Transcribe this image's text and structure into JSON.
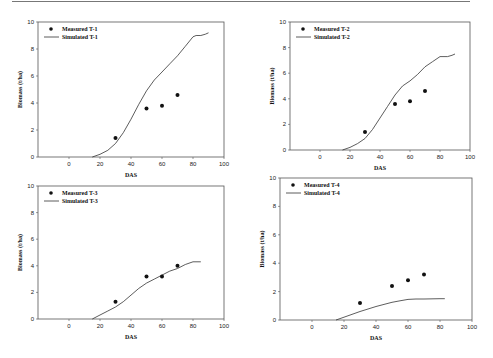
{
  "chart_data": [
    {
      "type": "line",
      "title": "",
      "xlabel": "DAS",
      "ylabel": "Biomass (t/ha)",
      "xlim": [
        -20,
        100
      ],
      "ylim": [
        0,
        10
      ],
      "xticks": [
        0,
        20,
        40,
        60,
        80,
        100
      ],
      "yticks": [
        0,
        2,
        4,
        6,
        8,
        10
      ],
      "grid": false,
      "legend_position": "upper-left",
      "series": [
        {
          "name": "Measured T-1",
          "kind": "scatter",
          "x": [
            30,
            50,
            60,
            70
          ],
          "y": [
            1.4,
            3.6,
            3.8,
            4.6
          ]
        },
        {
          "name": "Simulated T-1",
          "kind": "line",
          "x": [
            15,
            20,
            25,
            30,
            35,
            40,
            45,
            50,
            55,
            60,
            65,
            70,
            75,
            80,
            82,
            85,
            88,
            90
          ],
          "y": [
            0,
            0.2,
            0.5,
            1.0,
            1.8,
            2.8,
            3.9,
            4.9,
            5.7,
            6.3,
            6.9,
            7.5,
            8.2,
            8.9,
            9.0,
            9.0,
            9.1,
            9.2
          ]
        }
      ]
    },
    {
      "type": "line",
      "title": "",
      "xlabel": "DAS",
      "ylabel": "Biomass (t/ha)",
      "xlim": [
        -20,
        100
      ],
      "ylim": [
        0,
        10
      ],
      "xticks": [
        0,
        20,
        40,
        60,
        80,
        100
      ],
      "yticks": [
        0,
        2,
        4,
        6,
        8,
        10
      ],
      "grid": false,
      "legend_position": "upper-left",
      "series": [
        {
          "name": "Measured T-2",
          "kind": "scatter",
          "x": [
            30,
            50,
            60,
            70
          ],
          "y": [
            1.4,
            3.6,
            3.8,
            4.6
          ]
        },
        {
          "name": "Simulated T-2",
          "kind": "line",
          "x": [
            15,
            20,
            25,
            30,
            35,
            40,
            45,
            50,
            55,
            60,
            65,
            70,
            75,
            80,
            82,
            85,
            88,
            90
          ],
          "y": [
            0,
            0.2,
            0.5,
            0.9,
            1.6,
            2.5,
            3.4,
            4.3,
            5.0,
            5.4,
            5.9,
            6.5,
            6.9,
            7.3,
            7.3,
            7.3,
            7.4,
            7.5
          ]
        }
      ]
    },
    {
      "type": "line",
      "title": "",
      "xlabel": "DAS",
      "ylabel": "Biomass (t/ha)",
      "xlim": [
        -20,
        100
      ],
      "ylim": [
        0,
        10
      ],
      "xticks": [
        0,
        20,
        40,
        60,
        80,
        100
      ],
      "yticks": [
        0,
        2,
        4,
        6,
        8,
        10
      ],
      "grid": false,
      "legend_position": "upper-left",
      "series": [
        {
          "name": "Measured T-3",
          "kind": "scatter",
          "x": [
            30,
            50,
            60,
            70
          ],
          "y": [
            1.3,
            3.2,
            3.2,
            4.0
          ]
        },
        {
          "name": "Simulated T-3",
          "kind": "line",
          "x": [
            15,
            20,
            25,
            30,
            35,
            40,
            45,
            50,
            55,
            60,
            65,
            70,
            75,
            80,
            85
          ],
          "y": [
            0,
            0.3,
            0.6,
            0.9,
            1.3,
            1.8,
            2.3,
            2.7,
            3.0,
            3.3,
            3.6,
            3.8,
            4.1,
            4.3,
            4.3
          ]
        }
      ]
    },
    {
      "type": "line",
      "title": "",
      "xlabel": "DAS",
      "ylabel": "Biomass (t/ha)",
      "xlim": [
        -20,
        100
      ],
      "ylim": [
        0,
        10
      ],
      "xticks": [
        0,
        20,
        40,
        60,
        80,
        100
      ],
      "yticks": [
        0,
        2,
        4,
        6,
        8,
        10
      ],
      "grid": false,
      "legend_position": "upper-left",
      "series": [
        {
          "name": "Measured T-4",
          "kind": "scatter",
          "x": [
            30,
            50,
            60,
            70
          ],
          "y": [
            1.2,
            2.4,
            2.8,
            3.2
          ]
        },
        {
          "name": "Simulated T-4",
          "kind": "line",
          "x": [
            15,
            20,
            30,
            40,
            50,
            55,
            60,
            65,
            70,
            80,
            83
          ],
          "y": [
            0,
            0.2,
            0.6,
            0.95,
            1.25,
            1.35,
            1.45,
            1.48,
            1.48,
            1.5,
            1.5
          ]
        }
      ]
    }
  ],
  "panels": [
    {
      "id": "t1",
      "xlabel": "DAS",
      "ylabel": "Biomass (t/ha)",
      "legend_measured": "Measured T-1",
      "legend_simulated": "Simulated T-1"
    },
    {
      "id": "t2",
      "xlabel": "DAS",
      "ylabel": "Biomass (t/ha)",
      "legend_measured": "Measured T-2",
      "legend_simulated": "Simulated T-2"
    },
    {
      "id": "t3",
      "xlabel": "DAS",
      "ylabel": "Biomass (t/ha)",
      "legend_measured": "Measured T-3",
      "legend_simulated": "Simulated T-3"
    },
    {
      "id": "t4",
      "xlabel": "DAS",
      "ylabel": "Biomass (t/ha)",
      "legend_measured": "Measured T-4",
      "legend_simulated": "Simulated T-4"
    }
  ],
  "colors": {
    "line": "#333333",
    "marker": "#111111",
    "axis": "#555555"
  }
}
